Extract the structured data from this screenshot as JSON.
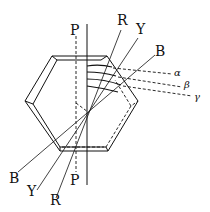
{
  "diagram": {
    "axis_labels": {
      "top": "P",
      "bottom": "P"
    },
    "rays_top": [
      {
        "label": "R"
      },
      {
        "label": "Y"
      },
      {
        "label": "B"
      }
    ],
    "rays_bottom": [
      {
        "label": "B"
      },
      {
        "label": "Y"
      },
      {
        "label": "R"
      }
    ],
    "angle_labels": [
      {
        "label": "α"
      },
      {
        "label": "β"
      },
      {
        "label": "γ"
      }
    ]
  }
}
